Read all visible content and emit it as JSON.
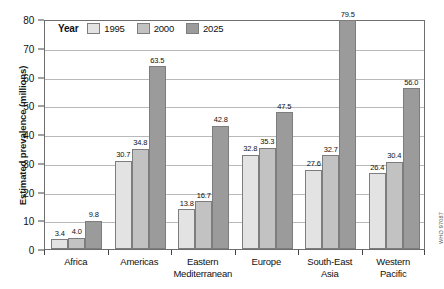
{
  "chart_data": {
    "type": "bar",
    "title": "",
    "xlabel": "",
    "ylabel": "Estimated prevalence (millions)",
    "ylim": [
      0,
      80
    ],
    "ytick_labels": [
      "0",
      "10",
      "20",
      "30",
      "40",
      "50",
      "60",
      "70",
      "80"
    ],
    "yticks": [
      0,
      10,
      20,
      30,
      40,
      50,
      60,
      70,
      80
    ],
    "grid": true,
    "legend_position": "top-left",
    "legend_title": "Year",
    "categories": [
      "Africa",
      "Americas",
      "Eastern Mediterranean",
      "Europe",
      "South-East Asia",
      "Western Pacific"
    ],
    "category_lines": [
      [
        "Africa"
      ],
      [
        "Americas"
      ],
      [
        "Eastern",
        "Mediterranean"
      ],
      [
        "Europe"
      ],
      [
        "South-East",
        "Asia"
      ],
      [
        "Western",
        "Pacific"
      ]
    ],
    "series": [
      {
        "name": "1995",
        "color": "#e3e3e3",
        "values": [
          3.4,
          30.7,
          13.8,
          32.8,
          27.6,
          26.4
        ],
        "labels": [
          "3.4",
          "30.7",
          "13.8",
          "32.8",
          "27.6",
          "26.4"
        ]
      },
      {
        "name": "2000",
        "color": "#c2c2c2",
        "values": [
          4.0,
          34.8,
          16.7,
          35.3,
          32.7,
          30.4
        ],
        "labels": [
          "4.0",
          "34.8",
          "16.7",
          "35.3",
          "32.7",
          "30.4"
        ]
      },
      {
        "name": "2025",
        "color": "#9b9b9b",
        "values": [
          9.8,
          63.5,
          42.8,
          47.5,
          79.5,
          56.0
        ],
        "labels": [
          "9.8",
          "63.5",
          "42.8",
          "47.5",
          "79.5",
          "56.0"
        ]
      }
    ]
  },
  "source_credit": "WHO 97087",
  "colors": {
    "series_1995": "#e3e3e3",
    "series_2000": "#c2c2c2",
    "series_2025": "#9b9b9b",
    "frame": "#6e6e6e",
    "gridline": "#b9b9b9",
    "text": "#111111"
  }
}
